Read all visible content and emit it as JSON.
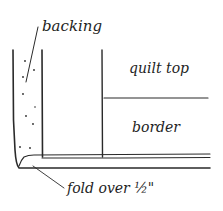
{
  "diagram": {
    "labels": {
      "backing": "backing",
      "quilt_top": "quilt top",
      "border": "border",
      "fold_over": "fold over ½\""
    },
    "colors": {
      "line": "#2a2a2a",
      "background": "#ffffff"
    },
    "components": [
      {
        "name": "backing",
        "description": "dotted layer on left, folded over"
      },
      {
        "name": "quilt top",
        "description": "upper right panel"
      },
      {
        "name": "border",
        "description": "lower right panel"
      },
      {
        "name": "fold over ½\"",
        "description": "backing folded under bottom edge"
      }
    ]
  }
}
